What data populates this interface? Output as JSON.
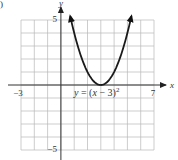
{
  "panel_marker": ")",
  "chart_data": {
    "type": "line",
    "title": "",
    "equation_label": "y = (x − 3)²",
    "equation_parts": {
      "lhs": "y",
      "eq": " = (",
      "var": "x",
      "rest": " − 3)",
      "exp": "2"
    },
    "xlabel": "x",
    "ylabel": "y",
    "xlim": [
      -3,
      7
    ],
    "ylim": [
      -5,
      5
    ],
    "grid": true,
    "grid_step": 1,
    "tick_labels": {
      "x": [
        {
          "value": -3,
          "label": "−3"
        },
        {
          "value": 7,
          "label": "7"
        }
      ],
      "y": [
        {
          "value": 5,
          "label": "5"
        },
        {
          "value": -5,
          "label": "−5"
        }
      ]
    },
    "series": [
      {
        "name": "y = (x - 3)^2",
        "function": "(x-3)^2",
        "x_domain": [
          0.7,
          5.3
        ],
        "arrows_both_ends": true,
        "vertex": [
          3,
          0
        ]
      }
    ]
  }
}
